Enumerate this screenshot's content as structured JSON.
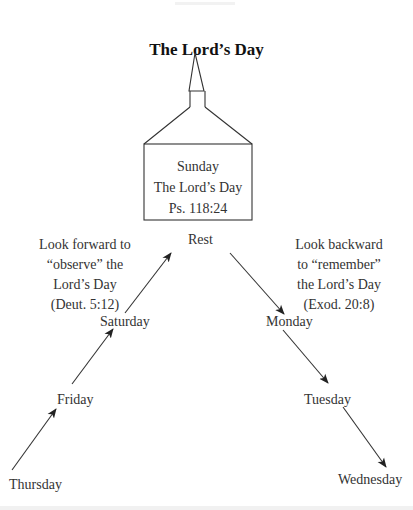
{
  "title": "The Lord’s Day",
  "church": {
    "lines": [
      "Sunday",
      "The Lord’s Day",
      "Ps. 118:24"
    ]
  },
  "center_node": "Rest",
  "left_note": {
    "lines": [
      "Look forward to",
      "“observe” the",
      "Lord’s Day",
      "(Deut. 5:12)"
    ]
  },
  "right_note": {
    "lines": [
      "Look backward",
      "to “remember”",
      "the Lord’s Day",
      "(Exod. 20:8)"
    ]
  },
  "ascending_days": [
    "Thursday",
    "Friday",
    "Saturday"
  ],
  "descending_days": [
    "Monday",
    "Tuesday",
    "Wednesday"
  ],
  "arrows": [
    {
      "from": "Thursday",
      "to": "Friday"
    },
    {
      "from": "Friday",
      "to": "Saturday"
    },
    {
      "from": "Saturday",
      "to": "Rest"
    },
    {
      "from": "Rest",
      "to": "Monday"
    },
    {
      "from": "Monday",
      "to": "Tuesday"
    },
    {
      "from": "Tuesday",
      "to": "Wednesday"
    }
  ],
  "colors": {
    "line": "#333333",
    "text": "#2a2a2a",
    "background": "#ffffff"
  }
}
